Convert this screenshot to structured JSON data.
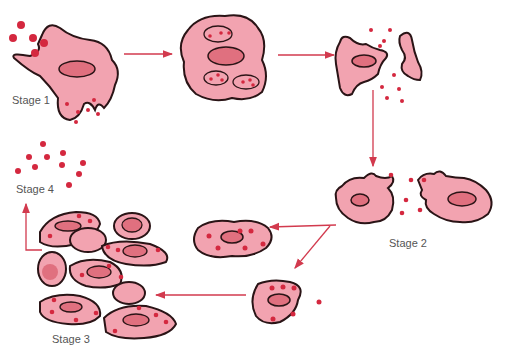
{
  "diagram": {
    "type": "life-cycle",
    "labels": {
      "stage1": "Stage 1",
      "stage2": "Stage 2",
      "stage3": "Stage 3",
      "stage4": "Stage 4"
    },
    "colors": {
      "cell_fill": "#f2a3b0",
      "cell_outline": "#2a1416",
      "nucleus_fill": "#e0707f",
      "particle": "#d4283f",
      "arrow": "#d23a4e",
      "label_text": "#555555"
    },
    "stages": [
      {
        "id": "stage1",
        "description": "Cell engulfing particles"
      },
      {
        "id": "stage1b",
        "description": "Cell with particle-filled vacuoles"
      },
      {
        "id": "stage1c",
        "description": "Cell rupturing, releasing particles"
      },
      {
        "id": "stage2",
        "description": "Two cells with particles between them"
      },
      {
        "id": "stage2b",
        "description": "Infected cells with particles"
      },
      {
        "id": "stage3",
        "description": "Cluster of cells"
      },
      {
        "id": "stage4",
        "description": "Free particles"
      }
    ]
  }
}
